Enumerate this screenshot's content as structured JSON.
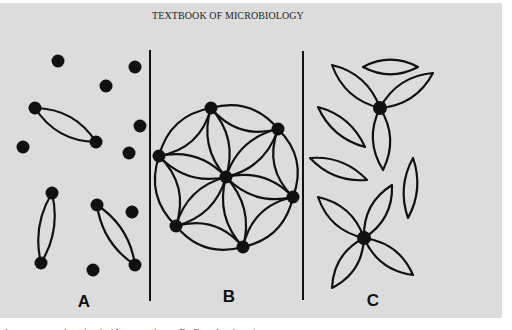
{
  "page": {
    "header": "TEXTBOOK OF MICROBIOLOGY",
    "background": "#dcdcdc",
    "ink": "#111111"
  },
  "figure": {
    "dividers": [
      {
        "x": 150,
        "y1": 50,
        "y2": 301
      },
      {
        "x": 303,
        "y1": 51,
        "y2": 300
      }
    ],
    "panels": [
      {
        "label": "A",
        "label_pos": [
          84,
          307
        ],
        "free_dots": [
          [
            58,
            61
          ],
          [
            135,
            67
          ],
          [
            106,
            86
          ],
          [
            140,
            126
          ],
          [
            129,
            153
          ],
          [
            23,
            147
          ],
          [
            132,
            212
          ],
          [
            93,
            270
          ]
        ],
        "spindles": [
          {
            "a": [
              35,
              108
            ],
            "b": [
              96,
              142
            ],
            "bulge": 14
          },
          {
            "a": [
              52,
              193
            ],
            "b": [
              41,
              263
            ],
            "bulge": 11
          },
          {
            "a": [
              97,
              205
            ],
            "b": [
              135,
              265
            ],
            "bulge": 12
          }
        ]
      },
      {
        "label": "B",
        "label_pos": [
          229,
          302
        ],
        "center": [
          226,
          177
        ],
        "outer_nodes": [
          [
            211,
            108
          ],
          [
            278,
            129
          ],
          [
            293,
            197
          ],
          [
            243,
            247
          ],
          [
            176,
            226
          ],
          [
            159,
            156
          ]
        ],
        "ring_bulge": 17,
        "spoke_bulge": 15
      },
      {
        "label": "C",
        "label_pos": [
          373,
          306
        ],
        "rosettes": [
          {
            "node": [
              380,
              108
            ],
            "petal_tips": [
              [
                332,
                65
              ],
              [
                433,
                73
              ],
              [
                383,
                170
              ]
            ],
            "bulge": 13
          },
          {
            "node": [
              364,
              238
            ],
            "petal_tips": [
              [
                318,
                197
              ],
              [
                392,
                185
              ],
              [
                332,
                288
              ],
              [
                413,
                275
              ]
            ],
            "bulge": 13
          }
        ],
        "free_lenses": [
          {
            "a": [
              363,
              67
            ],
            "b": [
              418,
              67
            ],
            "bulge": 11
          },
          {
            "a": [
              318,
              107
            ],
            "b": [
              365,
              147
            ],
            "bulge": 11
          },
          {
            "a": [
              310,
              158
            ],
            "b": [
              367,
              180
            ],
            "bulge": 11
          },
          {
            "a": [
              413,
              158
            ],
            "b": [
              408,
              218
            ],
            "bulge": 10
          }
        ]
      }
    ],
    "dot_radius": 6.5,
    "stroke_width": 2.2
  },
  "footer": {
    "text": "chromosomes in mitosis (A: metaphase; B, C: pole views)"
  }
}
